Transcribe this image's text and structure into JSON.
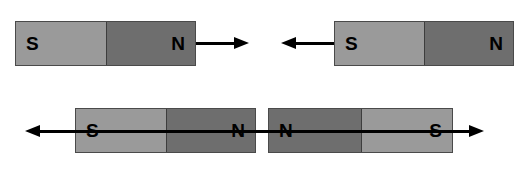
{
  "figure": {
    "background_color": "#ffffff",
    "pole_light_color": "#9a9a9a",
    "pole_dark_color": "#6e6e6e",
    "outline_color": "#4a4a4a",
    "arrow_color": "#000000"
  },
  "magnets": [
    {
      "id": "top-left-magnet",
      "left_pole_label": "S",
      "right_pole_label": "N",
      "left_pole_shade": "light",
      "right_pole_shade": "dark",
      "arrow_direction": "right",
      "arrow_style": "external"
    },
    {
      "id": "top-right-magnet",
      "left_pole_label": "S",
      "right_pole_label": "N",
      "left_pole_shade": "light",
      "right_pole_shade": "dark",
      "arrow_direction": "left",
      "arrow_style": "external"
    },
    {
      "id": "bottom-left-magnet",
      "left_pole_label": "S",
      "right_pole_label": "N",
      "left_pole_shade": "light",
      "right_pole_shade": "dark",
      "arrow_direction": "left",
      "arrow_style": "through"
    },
    {
      "id": "bottom-right-magnet",
      "left_pole_label": "N",
      "right_pole_label": "S",
      "left_pole_shade": "dark",
      "right_pole_shade": "light",
      "arrow_direction": "right",
      "arrow_style": "through"
    }
  ]
}
